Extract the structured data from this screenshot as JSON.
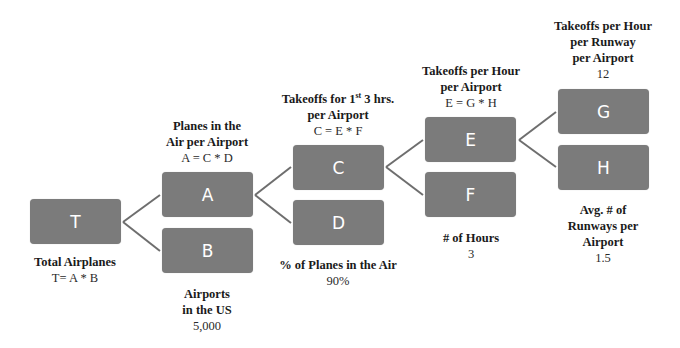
{
  "diagram": {
    "type": "driver-tree",
    "line_color": "#6e6e6e",
    "box_color": "#7b7b7b",
    "nodes": {
      "T": {
        "letter": "T",
        "title": "Total Airplanes",
        "formula": "T= A * B"
      },
      "A": {
        "letter": "A",
        "title_line1": "Planes in the",
        "title_line2": "Air per Airport",
        "formula": "A = C * D"
      },
      "B": {
        "letter": "B",
        "title_line1": "Airports",
        "title_line2": "in the US",
        "value": "5,000"
      },
      "C": {
        "letter": "C",
        "title_line1_pre": "Takeoffs for 1",
        "title_line1_sup": "st",
        "title_line1_post": " 3 hrs.",
        "title_line2": "per Airport",
        "formula": "C = E * F"
      },
      "D": {
        "letter": "D",
        "title": "% of Planes in the Air",
        "value": "90%"
      },
      "E": {
        "letter": "E",
        "title_line1": "Takeoffs per Hour",
        "title_line2": "per Airport",
        "formula": "E = G * H"
      },
      "F": {
        "letter": "F",
        "title": "# of Hours",
        "value": "3"
      },
      "G": {
        "letter": "G",
        "title_line1": "Takeoffs per Hour",
        "title_line2": "per Runway",
        "title_line3": "per Airport",
        "value": "12"
      },
      "H": {
        "letter": "H",
        "title_line1": "Avg. # of",
        "title_line2": "Runways per",
        "title_line3": "Airport",
        "value": "1.5"
      }
    },
    "edges": [
      [
        "T",
        "A"
      ],
      [
        "T",
        "B"
      ],
      [
        "A",
        "C"
      ],
      [
        "A",
        "D"
      ],
      [
        "C",
        "E"
      ],
      [
        "C",
        "F"
      ],
      [
        "E",
        "G"
      ],
      [
        "E",
        "H"
      ]
    ]
  }
}
